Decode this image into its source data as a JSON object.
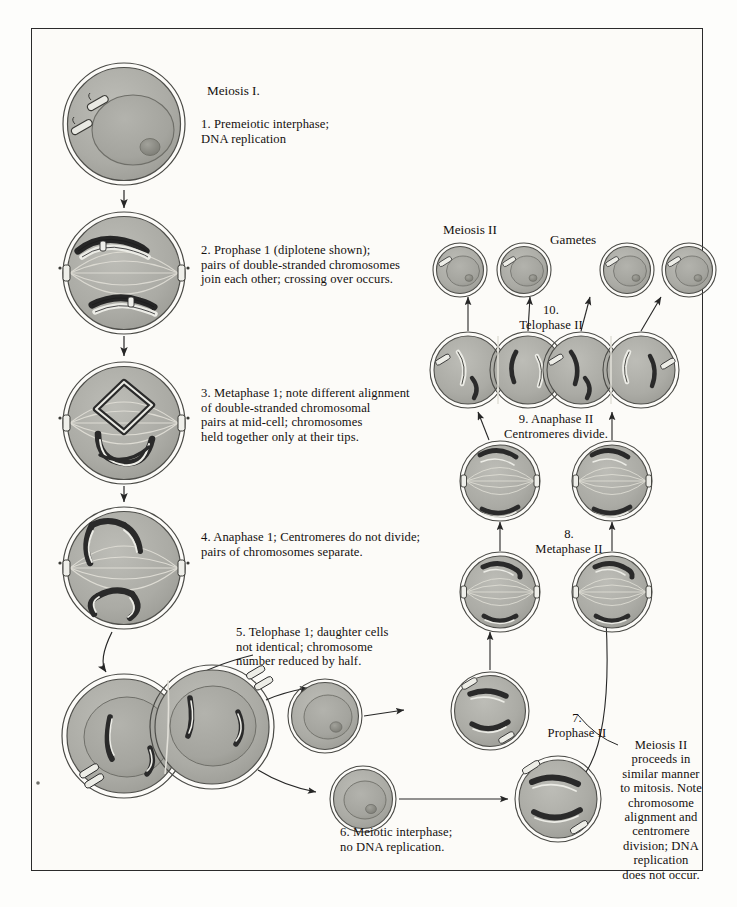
{
  "figure": {
    "title_left": "Meiosis I.",
    "title_meiosis2": "Meiosis II",
    "title_gametes": "Gametes"
  },
  "captions": {
    "step1": "1. Premeiotic interphase;\n    DNA replication",
    "step2": "2. Prophase 1 (diplotene shown);\n    pairs of double-stranded chromosomes\n    join each other; crossing over occurs.",
    "step3": "3. Metaphase 1; note different alignment\n    of double-stranded chromosomal\n    pairs at mid-cell; chromosomes\n    held together only at their tips.",
    "step4": "4. Anaphase 1; Centromeres do not divide;\n    pairs of chromosomes separate.",
    "step5": "5. Telophase 1; daughter cells\n    not identical; chromosome\n    number reduced by half.",
    "step6": "6. Meiotic interphase;\n    no DNA replication.",
    "step7": "7.\nProphase II",
    "step8": "8.\nMetaphase II",
    "step9": "9. Anaphase II\nCentromeres divide.",
    "step10": "10.\nTelophase II",
    "note": "Meiosis II\nproceeds in\nsimilar manner\nto mitosis. Note\nchromosome\nalignment and\ncentromere\ndivision; DNA\nreplication\ndoes not occur."
  },
  "colors": {
    "ink": "#14100e",
    "border": "#2b2b2b",
    "cell_fill": "#a9a9a4",
    "cell_fill_light": "#b9b9b4",
    "nucleus_fill": "#a3a39d",
    "chromosome_dark": "#2a2a2a",
    "chromosome_light": "#efefea",
    "page_bg": "#fcfbf8",
    "spindle": "#dcdcd6"
  },
  "cells": [
    {
      "id": "cell-1-premeiotic-interphase",
      "stage": "Premeiotic interphase",
      "x": 62,
      "y": 62,
      "r": 62
    },
    {
      "id": "cell-2-prophase-1",
      "stage": "Prophase 1 (diplotene)",
      "x": 62,
      "y": 208,
      "r": 62
    },
    {
      "id": "cell-3-metaphase-1",
      "stage": "Metaphase 1",
      "x": 62,
      "y": 358,
      "r": 62
    },
    {
      "id": "cell-4-anaphase-1",
      "stage": "Anaphase 1",
      "x": 62,
      "y": 503,
      "r": 62
    },
    {
      "id": "cell-5-telophase-1",
      "stage": "Telophase 1",
      "x": 58,
      "y": 668,
      "r": 62
    },
    {
      "id": "cell-6-meiotic-interphase-a",
      "stage": "Meiotic interphase",
      "x": 288,
      "y": 679,
      "r": 37
    },
    {
      "id": "cell-6-meiotic-interphase-b",
      "stage": "Meiotic interphase",
      "x": 330,
      "y": 766,
      "r": 33
    },
    {
      "id": "cell-7-prophase-ii-a",
      "stage": "Prophase II",
      "x": 452,
      "y": 672,
      "r": 39
    },
    {
      "id": "cell-7-prophase-ii-b",
      "stage": "Prophase II",
      "x": 516,
      "y": 762,
      "r": 42
    },
    {
      "id": "cell-8-metaphase-ii-a",
      "stage": "Metaphase II",
      "x": 461,
      "y": 552,
      "r": 40
    },
    {
      "id": "cell-8-metaphase-ii-b",
      "stage": "Metaphase II",
      "x": 573,
      "y": 552,
      "r": 40
    },
    {
      "id": "cell-9-anaphase-ii-a",
      "stage": "Anaphase II",
      "x": 461,
      "y": 441,
      "r": 40
    },
    {
      "id": "cell-9-anaphase-ii-b",
      "stage": "Anaphase II",
      "x": 573,
      "y": 441,
      "r": 40
    },
    {
      "id": "cell-10-telophase-ii-a",
      "stage": "Telophase II",
      "x": 438,
      "y": 330,
      "r": 38
    },
    {
      "id": "cell-10-telophase-ii-b",
      "stage": "Telophase II",
      "x": 551,
      "y": 330,
      "r": 38
    },
    {
      "id": "cell-gamete-1",
      "stage": "Gamete",
      "x": 433,
      "y": 243,
      "r": 27
    },
    {
      "id": "cell-gamete-2",
      "stage": "Gamete",
      "x": 497,
      "y": 243,
      "r": 27
    },
    {
      "id": "cell-gamete-3",
      "stage": "Gamete",
      "x": 600,
      "y": 243,
      "r": 27
    },
    {
      "id": "cell-gamete-4",
      "stage": "Gamete",
      "x": 662,
      "y": 243,
      "r": 27
    }
  ]
}
